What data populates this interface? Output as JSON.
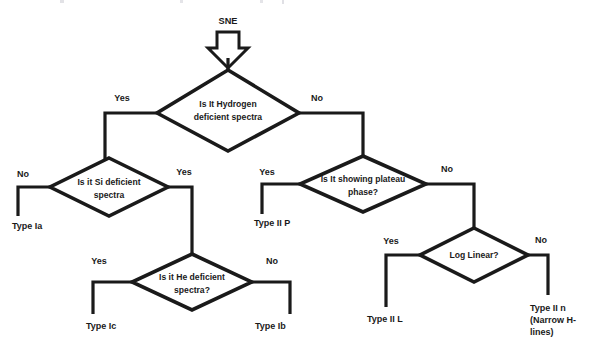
{
  "diagram": {
    "type": "decision-flowchart",
    "background_color": "#ffffff",
    "line_color": "#1a1a1a",
    "start": {
      "label": "SNE",
      "arrow_icon": "down-block-arrow"
    },
    "nodes": [
      {
        "id": "hydrogen",
        "shape": "diamond",
        "lines": [
          "Is It Hydrogen",
          "deficient spectra"
        ],
        "cx": 228,
        "cy": 108,
        "rx": 71,
        "ry": 38
      },
      {
        "id": "si",
        "shape": "diamond",
        "lines": [
          "Is it Si deficient",
          "spectra"
        ],
        "cx": 109,
        "cy": 187,
        "rx": 59,
        "ry": 29
      },
      {
        "id": "he",
        "shape": "diamond",
        "lines": [
          "Is it He deficient",
          "spectra?"
        ],
        "cx": 192,
        "cy": 282,
        "rx": 60,
        "ry": 28
      },
      {
        "id": "plateau",
        "shape": "diamond",
        "lines": [
          "Is It showing plateau",
          "phase?"
        ],
        "cx": 363,
        "cy": 184,
        "rx": 63,
        "ry": 28
      },
      {
        "id": "loglinear",
        "shape": "diamond",
        "lines": [
          "Log Linear?"
        ],
        "cx": 474,
        "cy": 255,
        "rx": 54,
        "ry": 27
      }
    ],
    "edge_labels": [
      {
        "id": "hydrogen-yes",
        "text": "Yes",
        "x": 122,
        "y": 101
      },
      {
        "id": "hydrogen-no",
        "text": "No",
        "x": 317,
        "y": 101
      },
      {
        "id": "si-no",
        "text": "No",
        "x": 23,
        "y": 177
      },
      {
        "id": "si-yes",
        "text": "Yes",
        "x": 184,
        "y": 175
      },
      {
        "id": "plateau-yes",
        "text": "Yes",
        "x": 267,
        "y": 175
      },
      {
        "id": "plateau-no",
        "text": "No",
        "x": 447,
        "y": 172
      },
      {
        "id": "he-yes",
        "text": "Yes",
        "x": 99,
        "y": 264
      },
      {
        "id": "he-no",
        "text": "No",
        "x": 272,
        "y": 264
      },
      {
        "id": "log-yes",
        "text": "Yes",
        "x": 391,
        "y": 244
      },
      {
        "id": "log-no",
        "text": "No",
        "x": 541,
        "y": 243
      }
    ],
    "terminals": [
      {
        "id": "type-ia",
        "lines": [
          "Type Ia"
        ],
        "x": 12,
        "y": 226,
        "anchor": "start"
      },
      {
        "id": "type-iip",
        "lines": [
          "Type II P"
        ],
        "x": 254,
        "y": 223,
        "anchor": "start"
      },
      {
        "id": "type-ic",
        "lines": [
          "Type Ic"
        ],
        "x": 86,
        "y": 327,
        "anchor": "start"
      },
      {
        "id": "type-ib",
        "lines": [
          "Type Ib"
        ],
        "x": 255,
        "y": 327,
        "anchor": "start"
      },
      {
        "id": "type-iil",
        "lines": [
          "Type II L"
        ],
        "x": 367,
        "y": 320,
        "anchor": "start"
      },
      {
        "id": "type-iin",
        "lines": [
          "Type II n",
          "(Narrow H-",
          "lines)"
        ],
        "x": 530,
        "y": 310,
        "anchor": "start"
      }
    ],
    "edges": [
      {
        "id": "start-to-hydrogen",
        "points": "228,58 228,70"
      },
      {
        "id": "hydrogen-yes-edge",
        "points": "157,113 105,113 105,160"
      },
      {
        "id": "hydrogen-no-edge",
        "points": "299,113 363,113 363,156"
      },
      {
        "id": "si-no-edge",
        "points": "50,187 18,187 18,216"
      },
      {
        "id": "si-yes-edge",
        "points": "168,187 192,187 192,254"
      },
      {
        "id": "he-yes-edge",
        "points": "132,282 93,282 93,314"
      },
      {
        "id": "he-no-edge",
        "points": "252,282 290,282 290,314"
      },
      {
        "id": "plateau-yes-edge",
        "points": "300,184 262,184 262,214"
      },
      {
        "id": "plateau-no-edge",
        "points": "426,184 474,184 474,228"
      },
      {
        "id": "log-yes-edge",
        "points": "420,255 386,255 386,307"
      },
      {
        "id": "log-no-edge",
        "points": "528,255 548,255 548,295"
      }
    ]
  }
}
